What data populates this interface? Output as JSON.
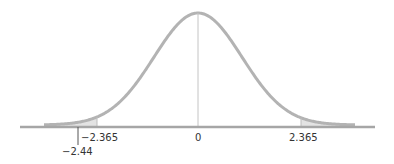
{
  "chart_data": {
    "type": "area",
    "title": "",
    "xlabel": "",
    "ylabel": "",
    "distribution": "bell curve (t distribution)",
    "critical_values": [
      -2.365,
      2.365
    ],
    "test_statistic": -2.44,
    "center": 0,
    "tick_labels": [
      "-2.365",
      "0",
      "2.365",
      "-2.44"
    ],
    "shaded_regions": [
      {
        "name": "left-tail",
        "from": "-inf",
        "to": -2.365
      },
      {
        "name": "right-tail",
        "from": 2.365,
        "to": "inf"
      }
    ],
    "grid": false,
    "legend": null
  },
  "labels": {
    "left_critical": "−2.365",
    "center": "0",
    "right_critical": "2.365",
    "test_stat": "−2.44"
  },
  "colors": {
    "curve": "#b3b3b3",
    "axis": "#a6a6a6",
    "shade": "#e3e3e3",
    "text": "#333333",
    "marker": "#555555"
  }
}
